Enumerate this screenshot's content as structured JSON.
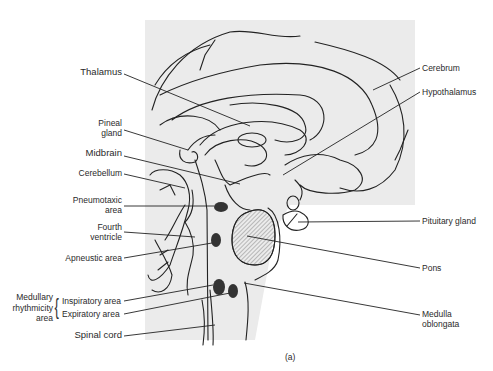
{
  "figure": {
    "panel_label": "(a)",
    "background_panel_color": "#ebebeb",
    "structure_fill": "#ececec",
    "nucleus_color": "#333333"
  },
  "labels": {
    "left": {
      "thalamus": "Thalamus",
      "pineal_gland_line1": "Pineal",
      "pineal_gland_line2": "gland",
      "midbrain": "Midbrain",
      "cerebellum": "Cerebellum",
      "pneumotaxic_line1": "Pneumotaxic",
      "pneumotaxic_line2": "area",
      "fourth_ventricle_line1": "Fourth",
      "fourth_ventricle_line2": "ventricle",
      "apneustic": "Apneustic area",
      "medullary_line1": "Medullary",
      "medullary_line2": "rhythmicity",
      "medullary_line3": "area",
      "inspiratory": "Inspiratory area",
      "expiratory": "Expiratory area",
      "spinal_cord": "Spinal cord"
    },
    "right": {
      "cerebrum": "Cerebrum",
      "hypothalamus": "Hypothalamus",
      "pituitary_gland": "Pituitary gland",
      "pons": "Pons",
      "medulla_line1": "Medulla",
      "medulla_line2": "oblongata"
    }
  }
}
